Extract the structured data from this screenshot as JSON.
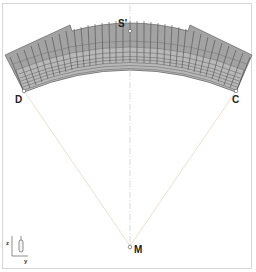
{
  "diagram": {
    "type": "dome-shell-section",
    "points": {
      "S": "S'",
      "D": "D",
      "C": "C",
      "M": "M"
    },
    "axes": {
      "vertical": "z",
      "horizontal": "y"
    },
    "colors": {
      "shell_fill": "#9a9a9a",
      "mesh_line": "#4a4a4a",
      "construction_line": "#e2d2c2",
      "centerline": "#cfcfcf",
      "border": "#d6d6d6"
    }
  }
}
